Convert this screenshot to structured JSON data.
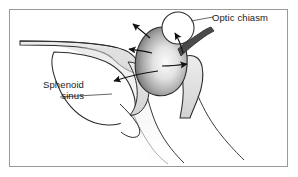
{
  "figure": {
    "background_color": "#ffffff",
    "frame_color": "#9a9a9a",
    "outline_color": "#2b2b2b",
    "bone_fill": "#e8e8e8",
    "mass_light": "#f2f2f2",
    "mass_dark": "#6e6e6e",
    "arrow_color": "#111111",
    "leader_color": "#555555",
    "text_color": "#1a1a1a"
  },
  "labels": {
    "optic_chiasm": {
      "text": "Optic chiasm",
      "lines": [
        "Optic chiasm"
      ]
    },
    "sphenoid_sinus": {
      "text": "Sphenoid sinus",
      "line1": "Sphenoid",
      "line2": "sinus"
    }
  },
  "structures": [
    {
      "name": "optic-chiasm-circle",
      "kind": "circle"
    },
    {
      "name": "pituitary-mass",
      "kind": "gradient-blob"
    },
    {
      "name": "sphenoid-sinus-cavity",
      "kind": "cavity"
    },
    {
      "name": "skull-base-bone",
      "kind": "bone"
    },
    {
      "name": "clivus",
      "kind": "bone"
    },
    {
      "name": "optic-nerve-band",
      "kind": "band"
    }
  ],
  "arrows": [
    {
      "name": "arrow-superior-left",
      "direction": "up-left"
    },
    {
      "name": "arrow-chiasm",
      "direction": "up-right"
    },
    {
      "name": "arrow-anterior-left",
      "direction": "left"
    },
    {
      "name": "arrow-inferior-sinus",
      "direction": "down-left"
    },
    {
      "name": "arrow-lateral-right",
      "direction": "right"
    }
  ]
}
